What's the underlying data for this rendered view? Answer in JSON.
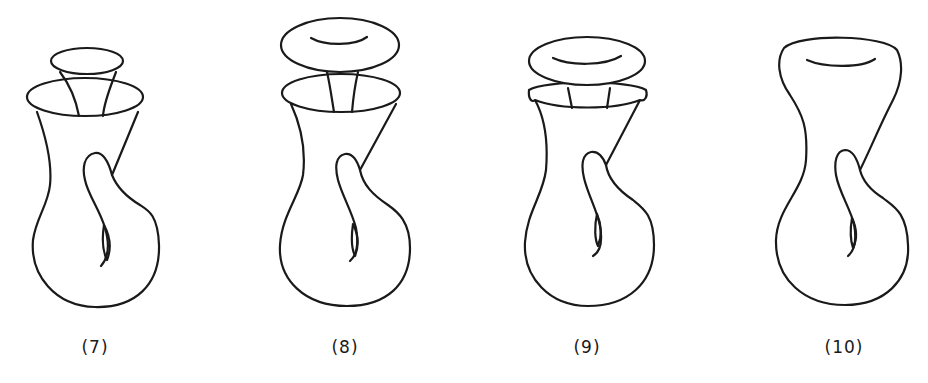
{
  "figures": [
    {
      "id": "7",
      "label": "(7)",
      "description": "Surface with small funnel tube inserted into flared rim"
    },
    {
      "id": "8",
      "label": "(8)",
      "description": "Surface with dome cap separated above rim, joined by tube"
    },
    {
      "id": "9",
      "label": "(9)",
      "description": "Surface with dome cap lowered onto rim ring"
    },
    {
      "id": "10",
      "label": "(10)",
      "description": "Smooth closed surface with self-intersecting handle"
    }
  ],
  "colors": {
    "line": "#1a1a1a",
    "background": "#ffffff"
  }
}
